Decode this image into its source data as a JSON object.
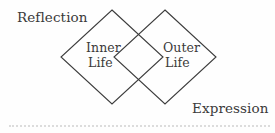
{
  "diagram": {
    "type": "venn-two-diamonds",
    "background_color": "#fefefe",
    "stroke_color": "#3c3c3c",
    "text_color": "#3b3a3a",
    "rule_color": "#dcdcdc",
    "outer_labels": {
      "top_left": "Reflection",
      "bottom_right": "Expression"
    },
    "shapes": [
      {
        "name": "inner-life-diamond",
        "label_line_1": "Inner",
        "label_line_2": "Life",
        "points": "112,10 163,57 112,104 61,57"
      },
      {
        "name": "outer-life-diamond",
        "label_line_1": "Outer",
        "label_line_2": "Life",
        "points": "165,10 216,57 165,104 114,57"
      }
    ],
    "divider": {
      "name": "bottom-dotted-rule",
      "style": "dotted"
    }
  }
}
